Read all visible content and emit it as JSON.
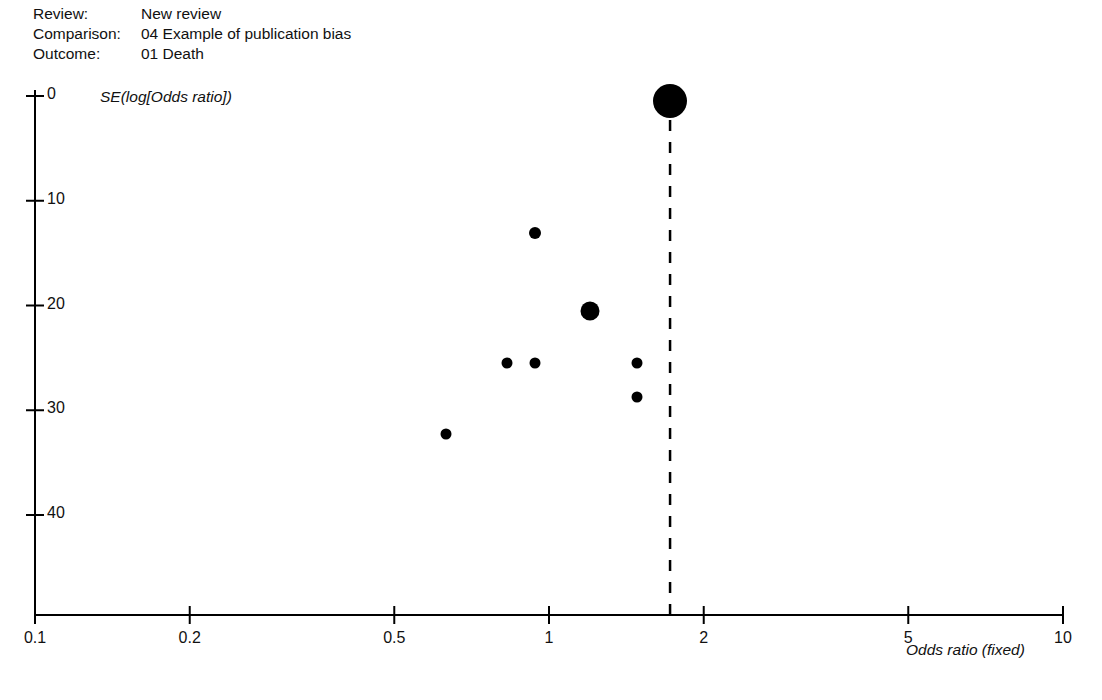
{
  "header": {
    "rows": [
      {
        "label": "Review:",
        "value": "New review"
      },
      {
        "label": "Comparison:",
        "value": "04 Example of publication bias"
      },
      {
        "label": "Outcome:",
        "value": "01 Death"
      }
    ]
  },
  "chart_data": {
    "type": "scatter",
    "title": "",
    "subtitle": "",
    "xlabel": "Odds ratio (fixed)",
    "ylabel": "SE(log[Odds ratio])",
    "xscale": "log",
    "xlim": [
      0.1,
      10
    ],
    "ylim": [
      0,
      47
    ],
    "y_inverted": true,
    "grid": false,
    "legend": null,
    "xticks": [
      {
        "value": 0.1,
        "label": "0.1"
      },
      {
        "value": 0.2,
        "label": "0.2"
      },
      {
        "value": 0.5,
        "label": "0.5"
      },
      {
        "value": 1,
        "label": "1"
      },
      {
        "value": 2,
        "label": "2"
      },
      {
        "value": 5,
        "label": "5"
      },
      {
        "value": 10,
        "label": "10"
      }
    ],
    "yticks": [
      {
        "value": 0,
        "label": "0"
      },
      {
        "value": 10,
        "label": "10"
      },
      {
        "value": 20,
        "label": "20"
      },
      {
        "value": 30,
        "label": "30"
      },
      {
        "value": 40,
        "label": "40"
      }
    ],
    "reference_line": {
      "type": "vertical-dashed",
      "x": 1.72,
      "color": "#000000"
    },
    "marker_color": "#000000",
    "points": [
      {
        "x": 1.72,
        "y": 0.5,
        "size": 34
      },
      {
        "x": 0.94,
        "y": 13.1,
        "size": 12
      },
      {
        "x": 1.2,
        "y": 20.5,
        "size": 19
      },
      {
        "x": 0.83,
        "y": 25.5,
        "size": 11
      },
      {
        "x": 0.94,
        "y": 25.5,
        "size": 11
      },
      {
        "x": 1.48,
        "y": 25.5,
        "size": 11
      },
      {
        "x": 1.48,
        "y": 28.7,
        "size": 11
      },
      {
        "x": 0.63,
        "y": 32.3,
        "size": 11
      }
    ]
  }
}
